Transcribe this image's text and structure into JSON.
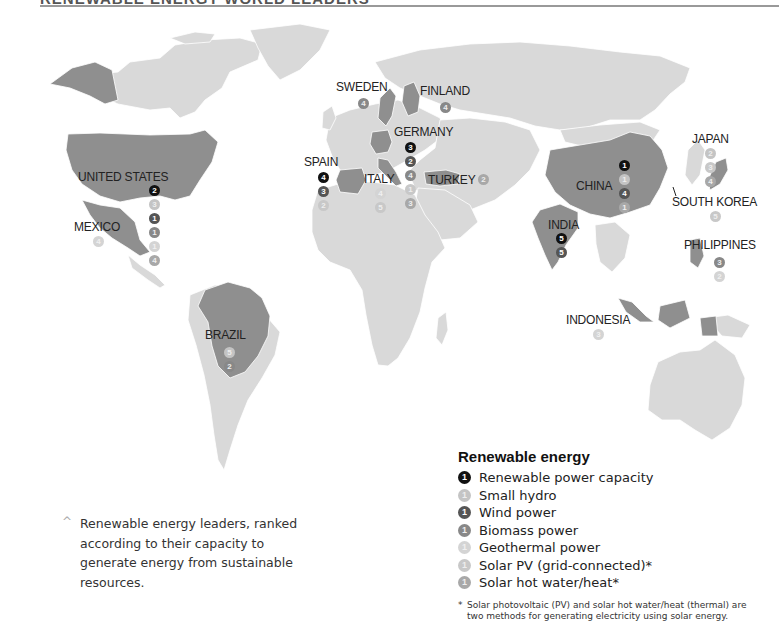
{
  "title": "RENEWABLE ENERGY WORLD LEADERS",
  "colors": {
    "ocean": "#ffffff",
    "land": "#d9d9d9",
    "leader_country": "#8f8f8f",
    "border": "#ffffff",
    "capacity": "#111111",
    "small_hydro": "#c4c4c4",
    "wind": "#555555",
    "biomass": "#888888",
    "geothermal": "#d4d4d4",
    "solar_pv": "#c8c8c8",
    "solar_hot_water": "#a8a8a8"
  },
  "legend": {
    "title": "Renewable energy",
    "items": [
      {
        "key": "capacity",
        "label": "Renewable power capacity",
        "rank": "1"
      },
      {
        "key": "hydro",
        "label": "Small hydro",
        "rank": "1"
      },
      {
        "key": "wind",
        "label": "Wind power",
        "rank": "1"
      },
      {
        "key": "biomass",
        "label": "Biomass power",
        "rank": "1"
      },
      {
        "key": "geo",
        "label": "Geothermal power",
        "rank": "1"
      },
      {
        "key": "pv",
        "label": "Solar PV (grid-connected)*",
        "rank": "1"
      },
      {
        "key": "hot",
        "label": "Solar hot water/heat*",
        "rank": "1"
      }
    ],
    "footnote_star": "*",
    "footnote": "Solar photovoltaic (PV) and solar hot water/heat (thermal) are two methods for generating electricity using solar energy."
  },
  "caption": {
    "caret": "^",
    "text": "Renewable energy leaders, ranked according to their capacity to generate energy from sustainable resources."
  },
  "countries": {
    "united_states": {
      "name": "UNITED STATES",
      "badges": [
        {
          "type": "capacity",
          "rank": "2"
        },
        {
          "type": "hydro",
          "rank": "3"
        },
        {
          "type": "wind",
          "rank": "1"
        },
        {
          "type": "biomass",
          "rank": "1"
        },
        {
          "type": "geo",
          "rank": "1"
        },
        {
          "type": "hot",
          "rank": "4"
        }
      ]
    },
    "mexico": {
      "name": "MEXICO",
      "badges": [
        {
          "type": "geo",
          "rank": "4"
        }
      ]
    },
    "brazil": {
      "name": "BRAZIL",
      "badges": [
        {
          "type": "hydro",
          "rank": "5"
        },
        {
          "type": "biomass",
          "rank": "2"
        }
      ]
    },
    "sweden": {
      "name": "SWEDEN",
      "badges": [
        {
          "type": "biomass",
          "rank": "4"
        }
      ]
    },
    "finland": {
      "name": "FINLAND",
      "badges": [
        {
          "type": "biomass",
          "rank": "4"
        }
      ]
    },
    "germany": {
      "name": "GERMANY",
      "badges": [
        {
          "type": "capacity",
          "rank": "3"
        },
        {
          "type": "wind",
          "rank": "2"
        },
        {
          "type": "biomass",
          "rank": "4"
        },
        {
          "type": "pv",
          "rank": "1"
        },
        {
          "type": "hot",
          "rank": "3"
        }
      ]
    },
    "spain": {
      "name": "SPAIN",
      "badges": [
        {
          "type": "capacity",
          "rank": "4"
        },
        {
          "type": "wind",
          "rank": "3"
        },
        {
          "type": "pv",
          "rank": "2"
        }
      ]
    },
    "italy": {
      "name": "ITALY",
      "badges": [
        {
          "type": "geo",
          "rank": "4"
        },
        {
          "type": "pv",
          "rank": "5"
        }
      ]
    },
    "turkey": {
      "name": "TURKEY",
      "badges": [
        {
          "type": "hot",
          "rank": "2"
        }
      ]
    },
    "china": {
      "name": "CHINA",
      "badges": [
        {
          "type": "capacity",
          "rank": "1"
        },
        {
          "type": "hydro",
          "rank": "1"
        },
        {
          "type": "wind",
          "rank": "4"
        },
        {
          "type": "hot",
          "rank": "1"
        }
      ]
    },
    "india": {
      "name": "INDIA",
      "badges": [
        {
          "type": "capacity",
          "rank": "5"
        },
        {
          "type": "wind",
          "rank": "5"
        }
      ]
    },
    "japan": {
      "name": "JAPAN",
      "badges": [
        {
          "type": "hydro",
          "rank": "2"
        },
        {
          "type": "pv",
          "rank": "3"
        },
        {
          "type": "hot",
          "rank": "4"
        }
      ]
    },
    "south_korea": {
      "name": "SOUTH KOREA",
      "badges": [
        {
          "type": "pv",
          "rank": "5"
        }
      ]
    },
    "philippines": {
      "name": "PHILIPPINES",
      "badges": [
        {
          "type": "biomass",
          "rank": "3"
        },
        {
          "type": "geo",
          "rank": "2"
        }
      ]
    },
    "indonesia": {
      "name": "INDONESIA",
      "badges": [
        {
          "type": "geo",
          "rank": "3"
        }
      ]
    }
  }
}
